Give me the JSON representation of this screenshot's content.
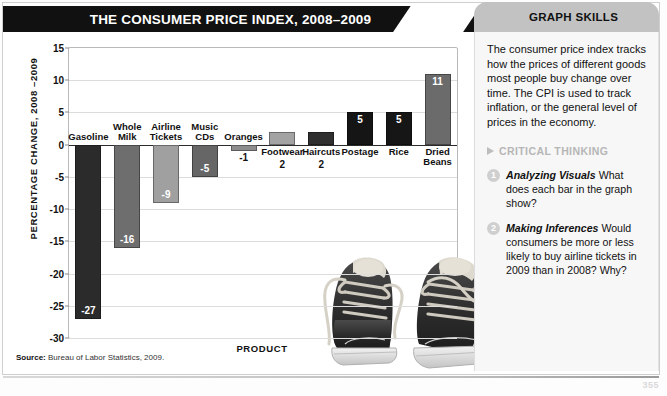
{
  "header": {
    "title": "THE CONSUMER PRICE INDEX, 2008–2009",
    "skills_tab": "GRAPH SKILLS"
  },
  "chart_data": {
    "type": "bar",
    "title": "THE CONSUMER PRICE INDEX, 2008–2009",
    "xlabel": "PRODUCT",
    "ylabel": "PERCENTAGE CHANGE, 2008 –2009",
    "ylim": [
      -30,
      15
    ],
    "yticks": [
      "15",
      "10",
      "5",
      "0",
      "-5",
      "-10",
      "-15",
      "-20",
      "-25",
      "-30"
    ],
    "ytick_values": [
      15,
      10,
      5,
      0,
      -5,
      -10,
      -15,
      -20,
      -25,
      -30
    ],
    "grid": true,
    "legend": "none",
    "categories": [
      "Gasoline",
      "Whole\nMilk",
      "Airline\nTickets",
      "Music\nCDs",
      "Oranges",
      "Footwear",
      "Haircuts",
      "Postage",
      "Rice",
      "Dried\nBeans"
    ],
    "values": [
      -27,
      -16,
      -9,
      -5,
      -1,
      2,
      2,
      5,
      5,
      11
    ],
    "labels": [
      "-27",
      "-16",
      "-9",
      "-5",
      "-1",
      "2",
      "2",
      "5",
      "5",
      "11"
    ],
    "bar_colors": [
      "#2b2b2b",
      "#6e6e6e",
      "#a0a0a0",
      "#666666",
      "#8d8d8d",
      "#a3a3a3",
      "#2f2f2f",
      "#151515",
      "#161616",
      "#6b6b6b"
    ],
    "source": "Bureau of Labor Statistics, 2009."
  },
  "source_label": "Source:",
  "side": {
    "intro": "The consumer price index tracks how the prices of different goods most people buy change over time. The CPI is used to track inflation, or the general level of prices in the economy.",
    "critical_thinking": "CRITICAL THINKING",
    "questions": [
      {
        "num": "1",
        "term": "Analyzing Visuals",
        "text": "What does each bar in the graph show?"
      },
      {
        "num": "2",
        "term": "Making Inferences",
        "text": "Would consumers be more or less likely to buy airline tickets in 2009 than in 2008? Why?"
      }
    ]
  },
  "page_number": "355"
}
